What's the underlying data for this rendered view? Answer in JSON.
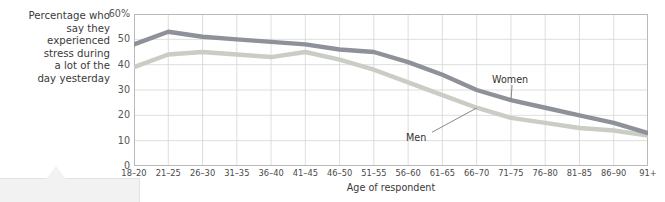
{
  "chart_data": {
    "type": "line",
    "title": "",
    "subtitle": "",
    "caption": "Percentage who\nsay they\nexperienced\nstress during\na lot of the\nday yesterday",
    "xlabel": "Age of respondent",
    "ylabel": "",
    "categories": [
      "18–20",
      "21–25",
      "26–30",
      "31–35",
      "36–40",
      "41–45",
      "46–50",
      "51–55",
      "56–60",
      "61–65",
      "66–70",
      "71–75",
      "76–80",
      "81–85",
      "86–90",
      "91+"
    ],
    "series": [
      {
        "name": "Women",
        "color": "#8e9199",
        "values": [
          48,
          53,
          51,
          50,
          49,
          48,
          46,
          45,
          41,
          36,
          30,
          26,
          23,
          20,
          17,
          13
        ]
      },
      {
        "name": "Men",
        "color": "#c9cdc4",
        "values": [
          39,
          44,
          45,
          44,
          43,
          45,
          42,
          38,
          33,
          28,
          23,
          19,
          17,
          15,
          14,
          12
        ]
      }
    ],
    "ylim": [
      0,
      60
    ],
    "yticks": [
      0,
      10,
      20,
      30,
      40,
      50,
      60
    ],
    "ytick_labels": [
      "0",
      "10",
      "20",
      "30",
      "40",
      "50",
      "60%"
    ],
    "grid": true,
    "grid_color": "#d6d6d6",
    "legend_position": "inline-annotations",
    "annotations": [
      {
        "text": "Women",
        "series": "Women",
        "point_index": 11
      },
      {
        "text": "Men",
        "series": "Men",
        "point_index": 10
      }
    ]
  }
}
